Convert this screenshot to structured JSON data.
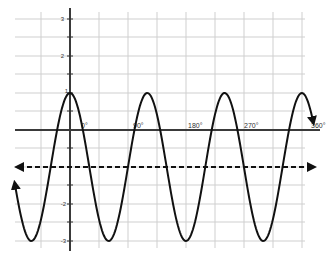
{
  "chart_data": {
    "type": "line",
    "title": "",
    "xlabel": "",
    "ylabel": "",
    "x_tick_labels": [
      "0°",
      "90°",
      "180°",
      "270°",
      "360°"
    ],
    "y_tick_labels": [
      "3",
      "2",
      "1",
      "-2",
      "-3"
    ],
    "grid": true,
    "ylim": [
      -3.3,
      3.3
    ],
    "series": [
      {
        "name": "y = 2cos(x) - 1 (wave)",
        "style": "solid",
        "amplitude": 2,
        "midline": -1,
        "max": 1,
        "min": -3,
        "maxima_count": 4,
        "minima_count": 4,
        "arrows": "both ends"
      },
      {
        "name": "midline y = -1",
        "style": "dashed",
        "value": -1,
        "arrows": "both ends"
      }
    ]
  },
  "labels": {
    "y3": "3",
    "y2": "2",
    "y1": "1",
    "yn2": "-2",
    "yn3": "-3",
    "x0": "0°",
    "x90": "90°",
    "x180": "180°",
    "x270": "270°",
    "x360": "360°"
  }
}
